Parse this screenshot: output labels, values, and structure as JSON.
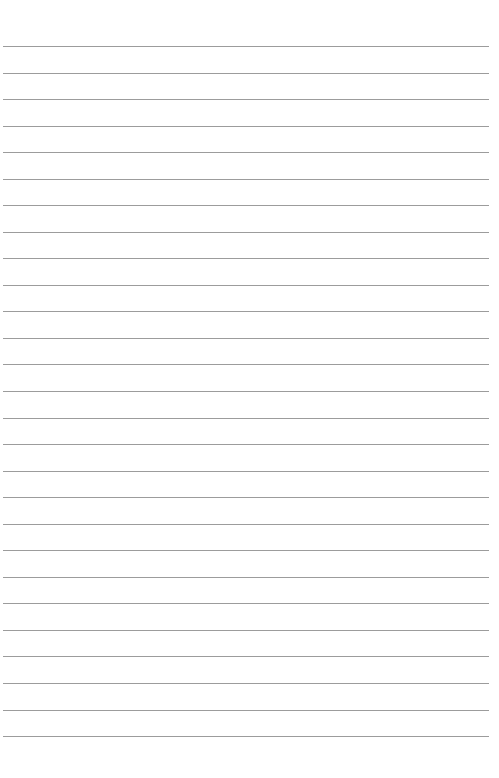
{
  "page": {
    "type": "lined-paper",
    "line_count": 27,
    "first_line_y": 46,
    "line_spacing": 26.54,
    "line_left": 3,
    "line_width": 486,
    "line_color": "#9c9c9c",
    "background": "#ffffff"
  }
}
